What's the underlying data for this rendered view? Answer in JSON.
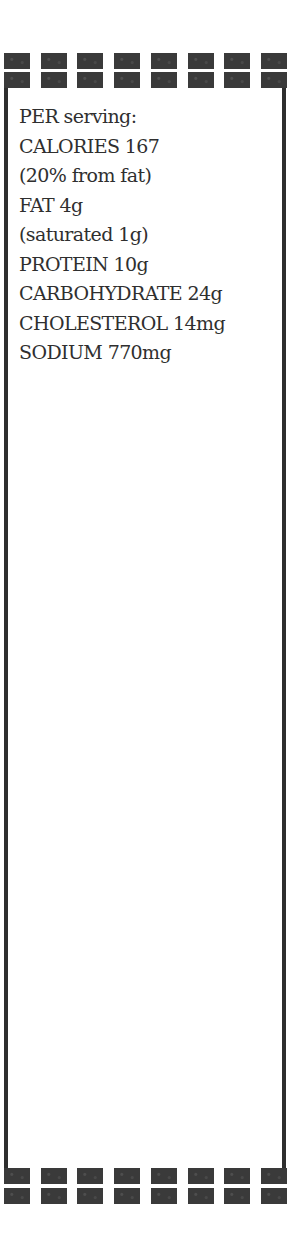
{
  "nutrition": {
    "heading": "PER serving:",
    "lines": [
      "CALORIES 167",
      "(20% from fat)",
      "FAT 4g",
      "(saturated 1g)",
      "PROTEIN 10g",
      "CARBOHYDRATE 24g",
      "CHOLESTEROL 14mg",
      "SODIUM 770mg"
    ]
  },
  "decor": {
    "square_columns": 8,
    "square_color": "#3a3a3a",
    "border_color": "#2e2e2e"
  }
}
